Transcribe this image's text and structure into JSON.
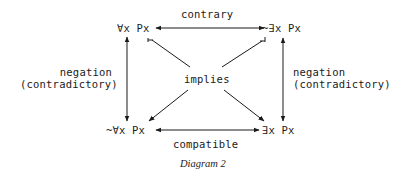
{
  "diagram": {
    "type": "square-of-opposition",
    "nodes": {
      "top_left": "∀x Px",
      "top_right": "~∃x Px",
      "bottom_left": "~∀x Px",
      "bottom_right": "∃x Px"
    },
    "edges": {
      "top": "contrary",
      "bottom": "compatible",
      "left_line1": "negation",
      "left_line2": "(contradictory)",
      "right_line1": "negation",
      "right_line2": "(contradictory)",
      "center": "implies"
    },
    "caption": "Diagram 2"
  }
}
